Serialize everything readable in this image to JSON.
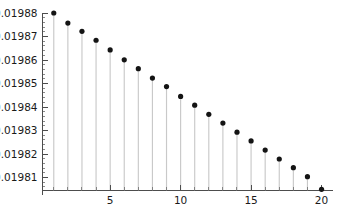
{
  "chart_data": {
    "type": "scatter",
    "plot_style": "stem",
    "title": "",
    "subtitle": "",
    "xlabel": "",
    "ylabel": "",
    "x": [
      1,
      2,
      3,
      4,
      5,
      6,
      7,
      8,
      9,
      10,
      11,
      12,
      13,
      14,
      15,
      16,
      17,
      18,
      19,
      20
    ],
    "values": [
      0.01988,
      0.0198757,
      0.0198722,
      0.0198684,
      0.0198643,
      0.0198601,
      0.0198563,
      0.0198523,
      0.0198487,
      0.0198445,
      0.0198408,
      0.0198369,
      0.0198332,
      0.0198293,
      0.0198256,
      0.0198217,
      0.0198179,
      0.0198142,
      0.0198104,
      0.019805
    ],
    "xlim": [
      0.2,
      20.6
    ],
    "ylim": [
      0.0198045,
      0.01988
    ],
    "grid": false,
    "legend": null,
    "legend_position": "none",
    "x_ticks_major": [
      5,
      10,
      15,
      20
    ],
    "x_tick_labels": [
      "5",
      "10",
      "15",
      "20"
    ],
    "x_ticks_minor": [
      1,
      2,
      3,
      4,
      6,
      7,
      8,
      9,
      11,
      12,
      13,
      14,
      16,
      17,
      18,
      19
    ],
    "y_ticks_major": [
      0.01981,
      0.01982,
      0.01983,
      0.01984,
      0.01985,
      0.01986,
      0.01987,
      0.01988
    ],
    "y_tick_labels": [
      "0.01981",
      "0.01982",
      "0.01983",
      "0.01984",
      "0.01985",
      "0.01986",
      "0.01987",
      "0.01988"
    ],
    "y_minor_per_major": 5,
    "marker": "filled-circle",
    "marker_color": "#141414",
    "stem_color": "#c9c9c9",
    "axis_color": "#4d4d4d",
    "background_color": "#ffffff"
  }
}
